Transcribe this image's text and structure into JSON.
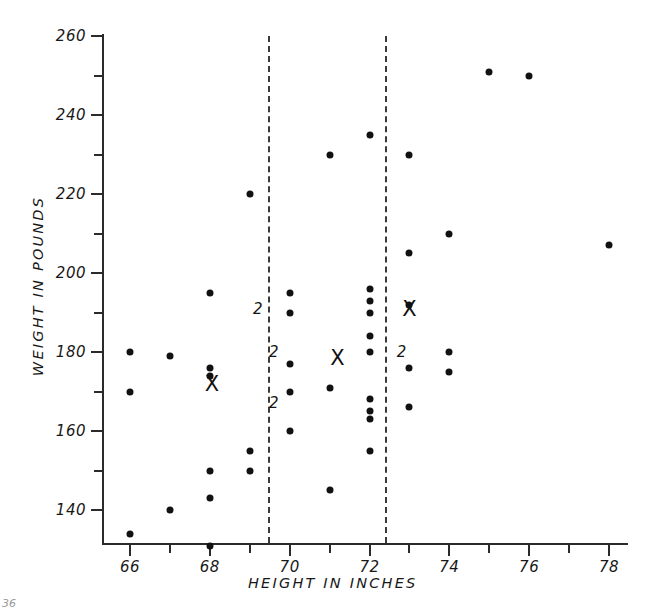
{
  "figure": {
    "x_axis_title": "HEIGHT IN INCHES",
    "y_axis_title": "WEIGHT IN POUNDS",
    "page_mark": "36"
  },
  "chart_data": {
    "type": "scatter",
    "title": "",
    "xlabel": "HEIGHT IN INCHES",
    "ylabel": "WEIGHT IN POUNDS",
    "xlim": [
      64.8,
      79.2
    ],
    "ylim": [
      130,
      262
    ],
    "grid": false,
    "legend": null,
    "x_ticks_major": [
      66,
      68,
      70,
      72,
      74,
      76,
      78
    ],
    "x_ticks_minor": [
      67,
      69,
      71,
      73,
      75,
      77,
      79
    ],
    "y_ticks_major": [
      140,
      160,
      180,
      200,
      220,
      240,
      260
    ],
    "y_ticks_minor": [
      150,
      170,
      190,
      210,
      230,
      250
    ],
    "x_tick_labels": [
      "66",
      "68",
      "70",
      "72",
      "74",
      "76",
      "78"
    ],
    "y_tick_labels": [
      "140",
      "160",
      "180",
      "200",
      "220",
      "240",
      "260"
    ],
    "points": [
      {
        "x": 66,
        "y": 180,
        "n": 1
      },
      {
        "x": 66,
        "y": 170,
        "n": 1
      },
      {
        "x": 66,
        "y": 134,
        "n": 1
      },
      {
        "x": 67,
        "y": 179,
        "n": 1
      },
      {
        "x": 67,
        "y": 140,
        "n": 1
      },
      {
        "x": 68,
        "y": 195,
        "n": 1
      },
      {
        "x": 68,
        "y": 176,
        "n": 1
      },
      {
        "x": 68,
        "y": 174,
        "n": 1
      },
      {
        "x": 68,
        "y": 150,
        "n": 1
      },
      {
        "x": 68,
        "y": 143,
        "n": 1
      },
      {
        "x": 68,
        "y": 131,
        "n": 1
      },
      {
        "x": 69,
        "y": 220,
        "n": 1
      },
      {
        "x": 69,
        "y": 155,
        "n": 1
      },
      {
        "x": 69,
        "y": 150,
        "n": 1
      },
      {
        "x": 70,
        "y": 195,
        "n": 1
      },
      {
        "x": 70,
        "y": 190,
        "n": 1
      },
      {
        "x": 70,
        "y": 177,
        "n": 1
      },
      {
        "x": 70,
        "y": 170,
        "n": 1
      },
      {
        "x": 70,
        "y": 160,
        "n": 1
      },
      {
        "x": 71,
        "y": 230,
        "n": 1
      },
      {
        "x": 71,
        "y": 171,
        "n": 1
      },
      {
        "x": 71,
        "y": 145,
        "n": 1
      },
      {
        "x": 72,
        "y": 235,
        "n": 1
      },
      {
        "x": 72,
        "y": 196,
        "n": 1
      },
      {
        "x": 72,
        "y": 193,
        "n": 1
      },
      {
        "x": 72,
        "y": 190,
        "n": 1
      },
      {
        "x": 72,
        "y": 184,
        "n": 1
      },
      {
        "x": 72,
        "y": 180,
        "n": 1
      },
      {
        "x": 72,
        "y": 168,
        "n": 1
      },
      {
        "x": 72,
        "y": 165,
        "n": 1
      },
      {
        "x": 72,
        "y": 163,
        "n": 1
      },
      {
        "x": 72,
        "y": 155,
        "n": 1
      },
      {
        "x": 73,
        "y": 230,
        "n": 1
      },
      {
        "x": 73,
        "y": 205,
        "n": 1
      },
      {
        "x": 73,
        "y": 192,
        "n": 1
      },
      {
        "x": 73,
        "y": 176,
        "n": 1
      },
      {
        "x": 73,
        "y": 166,
        "n": 1
      },
      {
        "x": 74,
        "y": 210,
        "n": 1
      },
      {
        "x": 74,
        "y": 180,
        "n": 1
      },
      {
        "x": 74,
        "y": 175,
        "n": 1
      },
      {
        "x": 75,
        "y": 251,
        "n": 1
      },
      {
        "x": 76,
        "y": 250,
        "n": 1
      },
      {
        "x": 78,
        "y": 207,
        "n": 1
      }
    ],
    "overlapping_counts": [
      {
        "x": 69.2,
        "y": 191,
        "label": "2"
      },
      {
        "x": 69.6,
        "y": 180,
        "label": "2"
      },
      {
        "x": 69.6,
        "y": 167,
        "label": "2"
      },
      {
        "x": 72.8,
        "y": 180,
        "label": "2"
      }
    ],
    "group_means": [
      {
        "x": 68.05,
        "y": 172,
        "marker": "X"
      },
      {
        "x": 71.2,
        "y": 178.5,
        "marker": "X"
      },
      {
        "x": 73.0,
        "y": 191,
        "marker": "X"
      }
    ],
    "dividers": [
      {
        "x": 69.45,
        "style": "dashed"
      },
      {
        "x": 72.4,
        "style": "dashed"
      }
    ],
    "annotations": []
  }
}
